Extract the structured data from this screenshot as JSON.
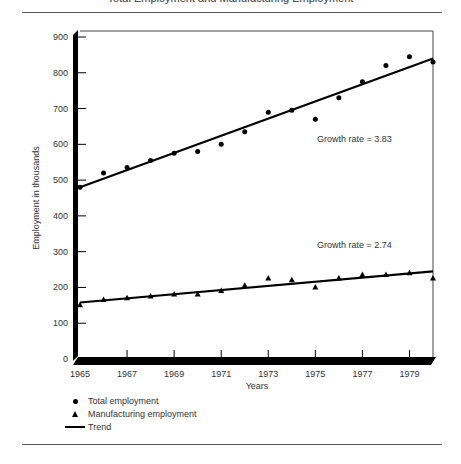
{
  "page": {
    "title": "Total Employment and Manufacturing Employment",
    "ylabel": "Employment in thousands",
    "xlabel": "Years",
    "annotations": {
      "total_growth": "Growth rate = 3.83",
      "mfg_growth": "Growth rate = 2.74"
    },
    "legend": {
      "total": "Total employment",
      "manufacturing": "Manufacturing employment",
      "trend": "Trend"
    },
    "yticks": [
      "0",
      "100",
      "200",
      "300",
      "400",
      "500",
      "600",
      "700",
      "800",
      "900"
    ],
    "xticks": [
      "1965",
      "1967",
      "1969",
      "1971",
      "1973",
      "1975",
      "1977",
      "1979"
    ]
  },
  "chart_data": {
    "type": "scatter",
    "title": "",
    "xlabel": "Years",
    "ylabel": "Employment in thousands",
    "xlim": [
      1965,
      1980
    ],
    "ylim": [
      0,
      900
    ],
    "grid": false,
    "legend_position": "bottom-left",
    "x": [
      1965,
      1966,
      1967,
      1968,
      1969,
      1970,
      1971,
      1972,
      1973,
      1974,
      1975,
      1976,
      1977,
      1978,
      1979,
      1980
    ],
    "series": [
      {
        "name": "Total employment",
        "marker": "circle",
        "values": [
          480,
          520,
          535,
          555,
          575,
          580,
          600,
          635,
          690,
          695,
          670,
          730,
          775,
          820,
          845,
          830
        ]
      },
      {
        "name": "Manufacturing employment",
        "marker": "triangle",
        "values": [
          150,
          165,
          170,
          175,
          180,
          180,
          190,
          205,
          225,
          220,
          200,
          225,
          235,
          235,
          240,
          225
        ]
      }
    ],
    "trends": [
      {
        "name": "Trend (Total employment)",
        "start": [
          1965,
          480
        ],
        "end": [
          1980,
          840
        ],
        "label": "Growth rate = 3.83"
      },
      {
        "name": "Trend (Manufacturing employment)",
        "start": [
          1965,
          158
        ],
        "end": [
          1980,
          245
        ],
        "label": "Growth rate = 2.74"
      }
    ]
  }
}
